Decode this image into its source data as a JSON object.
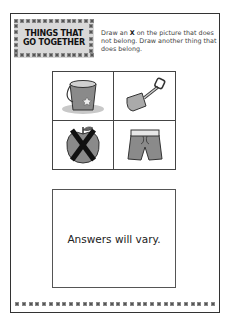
{
  "worksheet": {
    "title_lines": [
      "THINGS THAT",
      "GO TOGETHER"
    ],
    "instructions": {
      "before_x": "Draw an ",
      "x_mark": "X",
      "after_x": " on the picture that does not belong. Draw another thing that does belong."
    },
    "pictures": [
      {
        "name": "sand-bucket",
        "crossed_out": false
      },
      {
        "name": "shovel",
        "crossed_out": false
      },
      {
        "name": "apple",
        "crossed_out": true
      },
      {
        "name": "swim-trunks",
        "crossed_out": false
      }
    ],
    "answer_box": {
      "text": "Answers will vary."
    }
  },
  "colors": {
    "title_background": "#d9d9d9",
    "border": "#333333",
    "picture_gray": "#8a8a8a"
  }
}
